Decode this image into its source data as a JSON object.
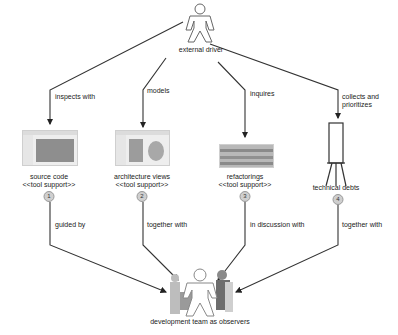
{
  "actors": {
    "external_driver": {
      "label": "external driver"
    },
    "development_team": {
      "label": "development team as observers"
    }
  },
  "top_edges": [
    {
      "id": "inspects",
      "label": "inspects with"
    },
    {
      "id": "models",
      "label": "models"
    },
    {
      "id": "inquires",
      "label": "inquires"
    },
    {
      "id": "collects",
      "label_line1": "collects and",
      "label_line2": "prioritizes"
    }
  ],
  "artifacts": [
    {
      "number": "1",
      "title": "source code",
      "stereotype": "<<tool support>>"
    },
    {
      "number": "2",
      "title": "architecture views",
      "stereotype": "<<tool support>>"
    },
    {
      "number": "3",
      "title": "refactorings",
      "stereotype": "<<tool support>>"
    },
    {
      "number": "4",
      "title": "technical debts"
    }
  ],
  "bottom_edges": [
    {
      "id": "guided",
      "label": "guided by"
    },
    {
      "id": "together1",
      "label": "together with"
    },
    {
      "id": "discussion",
      "label": "in discussion with"
    },
    {
      "id": "together2",
      "label": "together with"
    }
  ],
  "colors": {
    "line": "#333333",
    "badge": "#cfcfcf",
    "screenshot_fill": "#9a9a9a"
  }
}
